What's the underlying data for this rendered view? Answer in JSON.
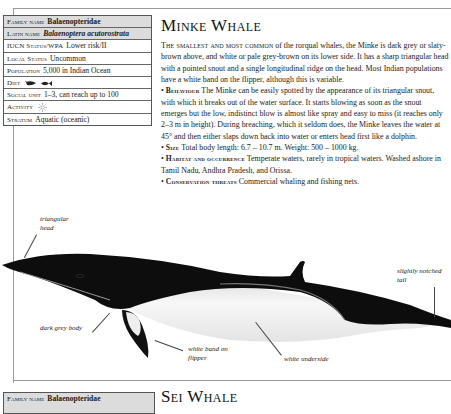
{
  "page": {
    "running_header": "Cetaceans — Rorquals (Baleen Whales)"
  },
  "info_table": {
    "rows": [
      {
        "label": "Family name",
        "value": "Balaenopteridae",
        "shaded": true,
        "italic": false
      },
      {
        "label": "Latin name",
        "value": "Balaenoptera acutorostrata",
        "shaded": true,
        "italic": true
      },
      {
        "label": "IUCN Status/WPA",
        "value": "Lower risk/II",
        "shaded": false,
        "italic": false
      },
      {
        "label": "Local Status",
        "value": "Uncommon",
        "shaded": false,
        "italic": false
      },
      {
        "label": "Population",
        "value": "5,000 in Indian Ocean",
        "shaded": false,
        "italic": false
      },
      {
        "label": "Diet",
        "value": "",
        "icons": [
          "krill-icon",
          "fish-icon"
        ],
        "shaded": false,
        "italic": false
      },
      {
        "label": "Social unit",
        "value": "1–3, can reach up to 100",
        "shaded": false,
        "italic": false
      },
      {
        "label": "Activity",
        "value": "",
        "icons": [
          "sun-icon"
        ],
        "shaded": false,
        "italic": false
      },
      {
        "label": "Stratum",
        "value": "Aquatic (oceanic)",
        "shaded": false,
        "italic": false
      }
    ]
  },
  "species": {
    "title": "Minke Whale",
    "intro_lead": "The smallest and most common",
    "intro_rest": " of the rorqual whales, the Minke is dark grey or slaty-brown above, and white or pale grey-brown on its lower side. It has a sharp triangular head with a pointed snout and a single longitudinal ridge on the head. Most Indian populations have a white band on the flipper, although this is variable.",
    "sections": [
      {
        "heading": "Behaviour",
        "text": " The Minke can be easily spotted by the appearance of its triangular snout, with which it breaks out of the water surface. It starts blowing as soon as the snout emerges but the low, indistinct blow is almost like spray and easy to miss (it reaches only 2–3 m in height). During breaching, which it seldom does, the Minke leaves the water at 45° and then either slaps down back into water or enters head first like a dolphin."
      },
      {
        "heading": "Size",
        "text": " Total body length: 6.7 – 10.7 m. Weight: 500 – 1000 kg."
      },
      {
        "heading": "Habitat and occurrence",
        "text": " Temperate waters, rarely in tropical waters. Washed ashore in Tamil Nadu, Andhra Pradesh, and Orissa."
      },
      {
        "heading": "Conservation threats",
        "text": " Commercial whaling and fishing nets."
      }
    ]
  },
  "illustration": {
    "labels": {
      "head": "triangular head",
      "tail": "slightly notched tail",
      "body": "dark grey body",
      "flipper": "white band on flipper",
      "underside": "white underside"
    },
    "colors": {
      "dark": "#0d0d0d",
      "light": "#f2f2f2",
      "mid": "#8a8a8a"
    }
  },
  "next_species": {
    "title": "Sei Whale",
    "family_label": "Family name",
    "family_value": "Balaenopteridae"
  }
}
